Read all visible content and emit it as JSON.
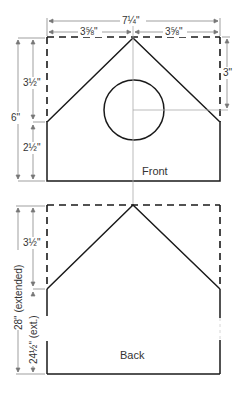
{
  "front": {
    "label": "Front",
    "dims": {
      "total_width": "7¼\"",
      "half_width_left": "3⅝\"",
      "half_width_right": "3⅝\"",
      "total_height": "6\"",
      "roof_height": "3½\"",
      "wall_height": "2½\"",
      "hole_offset": "3\""
    }
  },
  "back": {
    "label": "Back",
    "dims": {
      "total_height": "28\" (extended)",
      "wall_height": "24½\" (ext.)",
      "roof_height": "3½\""
    }
  },
  "colors": {
    "outline": "#1a1a1a",
    "dimension": "#777777",
    "guide": "#aaaaaa"
  }
}
